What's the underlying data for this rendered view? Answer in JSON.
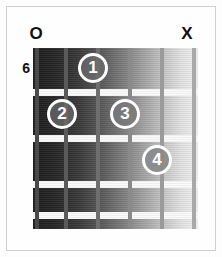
{
  "diagram": {
    "type": "guitar-chord-diagram",
    "starting_fret_label": "6",
    "string_markers": [
      {
        "string": 1,
        "symbol": "O",
        "meaning": "open"
      },
      {
        "string": 6,
        "symbol": "X",
        "meaning": "muted"
      }
    ],
    "strings": [
      {
        "index": 1,
        "x": 2
      },
      {
        "index": 2,
        "x": 31
      },
      {
        "index": 3,
        "x": 63
      },
      {
        "index": 4,
        "x": 95
      },
      {
        "index": 5,
        "x": 127
      },
      {
        "index": 6,
        "x": 159
      }
    ],
    "fret_lines_y": [
      43,
      89,
      135,
      171,
      166
    ],
    "fingers": [
      {
        "label": "1",
        "string": 3,
        "fret": 1,
        "x": 78,
        "y": 53,
        "shade": "on-dark"
      },
      {
        "label": "2",
        "string": 2,
        "fret": 2,
        "x": 47,
        "y": 99,
        "shade": "on-dark"
      },
      {
        "label": "3",
        "string": 4,
        "fret": 2,
        "x": 110,
        "y": 99,
        "shade": "on-mid"
      },
      {
        "label": "4",
        "string": 5,
        "fret": 3,
        "x": 142,
        "y": 145,
        "shade": "on-light"
      }
    ],
    "colors": {
      "background": "#fdfdfd",
      "frame_border": "#cfcfcf",
      "fret_line": "#fbfbfb",
      "marker_text": "#111111",
      "finger_ring": "#ffffff",
      "finger_text": "#ffffff"
    }
  }
}
